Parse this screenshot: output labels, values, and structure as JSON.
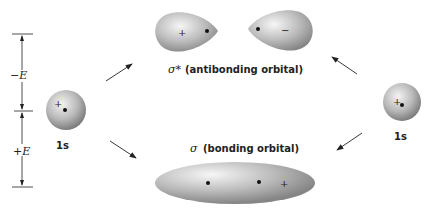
{
  "energy_axis": {
    "minus_label": "−E",
    "plus_label": "+E"
  },
  "left_orbital": {
    "label": "1s",
    "sign": "+"
  },
  "right_orbital": {
    "label": "1s",
    "sign": "+"
  },
  "antibonding": {
    "symbol": "σ*",
    "label": "(antibonding orbital)",
    "left_lobe_sign": "+",
    "right_lobe_sign": "−"
  },
  "bonding": {
    "symbol": "σ",
    "label": "(bonding orbital)",
    "sign": "+"
  },
  "colors": {
    "ink": "#222222",
    "orbital_light": "#f2f2f2",
    "orbital_dark": "#8a8a8a"
  }
}
